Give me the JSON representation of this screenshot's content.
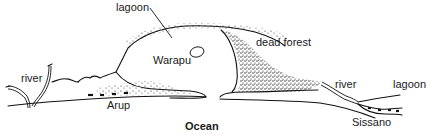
{
  "diagram": {
    "labels": {
      "lagoon_top": "lagoon",
      "warapu": "Warapu",
      "dead_forest": "dead forest",
      "river_left": "river",
      "arup": "Arup",
      "river_right": "river",
      "lagoon_right": "lagoon",
      "sissano": "Sissano",
      "ocean": "Ocean"
    },
    "colors": {
      "ink": "#111111",
      "background": "#ffffff"
    }
  }
}
